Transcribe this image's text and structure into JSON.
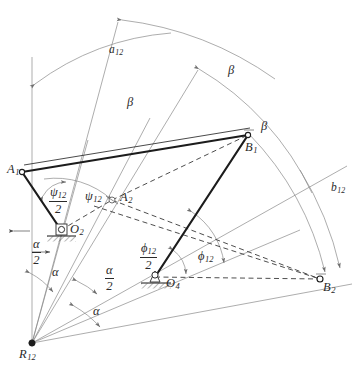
{
  "figure": {
    "type": "kinematic-synthesis-diagram",
    "colors": {
      "link_line": "#1c1c1c",
      "construction_line": "#7a7a7a",
      "dashed_line": "#3a3a3a",
      "text": "#2a2a2a",
      "background": "#ffffff"
    }
  },
  "points": {
    "A1": {
      "label": "A",
      "sub": "1",
      "x": 22,
      "y": 172
    },
    "A2": {
      "label": "A",
      "sub": "2",
      "x": 112,
      "y": 200
    },
    "B1": {
      "label": "B",
      "sub": "1",
      "x": 248,
      "y": 135
    },
    "B2": {
      "label": "B",
      "sub": "2",
      "x": 320,
      "y": 279
    },
    "O2": {
      "label": "O",
      "sub": "2",
      "x": 61,
      "y": 230
    },
    "O4": {
      "label": "O",
      "sub": "4",
      "x": 155,
      "y": 277
    },
    "R12": {
      "label": "R",
      "sub": "12",
      "x": 32,
      "y": 343
    }
  },
  "labels": {
    "a12": {
      "text": "a",
      "sub": "12"
    },
    "b12": {
      "text": "b",
      "sub": "12"
    },
    "beta_outer": {
      "text": "β"
    },
    "beta_mid": {
      "text": "β"
    },
    "beta_inner": {
      "text": "β"
    },
    "psi12": {
      "text": "ψ",
      "sub": "12"
    },
    "psi12_half": {
      "num": "ψ",
      "num_sub": "12",
      "den": "2"
    },
    "phi12": {
      "text": "ϕ",
      "sub": "12"
    },
    "phi12_half": {
      "num": "ϕ",
      "num_sub": "12",
      "den": "2"
    },
    "alpha_upper": {
      "text": "α"
    },
    "alpha_lower": {
      "text": "α"
    },
    "alpha_half_left": {
      "num": "α",
      "den": "2"
    },
    "alpha_half_mid": {
      "num": "α",
      "den": "2"
    }
  },
  "label_positions": {
    "A1": {
      "x": 7,
      "y": 163
    },
    "A2": {
      "x": 120,
      "y": 192
    },
    "B1": {
      "x": 246,
      "y": 141
    },
    "B2": {
      "x": 323,
      "y": 281
    },
    "O2": {
      "x": 70,
      "y": 224
    },
    "O4": {
      "x": 166,
      "y": 279
    },
    "R12": {
      "x": 19,
      "y": 349
    },
    "a12": {
      "x": 110,
      "y": 44
    },
    "b12": {
      "x": 331,
      "y": 184
    },
    "beta_outer": {
      "x": 228,
      "y": 65
    },
    "beta_mid": {
      "x": 127,
      "y": 97
    },
    "beta_inner": {
      "x": 261,
      "y": 121
    },
    "psi12": {
      "x": 85,
      "y": 190
    },
    "psi12_half": {
      "x": 51,
      "y": 189
    },
    "phi12": {
      "x": 198,
      "y": 251
    },
    "phi12_half": {
      "x": 142,
      "y": 245
    },
    "alpha_upper": {
      "x": 52,
      "y": 267
    },
    "alpha_lower": {
      "x": 93,
      "y": 306
    },
    "alpha_half_left": {
      "x": 33,
      "y": 242
    },
    "alpha_half_mid": {
      "x": 106,
      "y": 268
    }
  }
}
